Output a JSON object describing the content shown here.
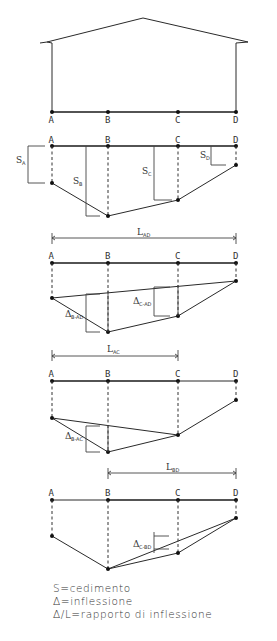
{
  "diagram": {
    "points": [
      "A",
      "B",
      "C",
      "D"
    ],
    "panels": [
      {
        "id": "building",
        "description": "Edificio su fondazione A-B-C-D"
      },
      {
        "id": "settlement",
        "labels": {
          "SA": "S",
          "SA_sub": "A",
          "SB": "S",
          "SB_sub": "B",
          "SC": "S",
          "SC_sub": "C",
          "SD": "S",
          "SD_sub": "D"
        }
      },
      {
        "id": "deflection-AD",
        "span_label": "L",
        "span_sub": "AD",
        "deltas": [
          {
            "sym": "Δ",
            "sub": "B-AD"
          },
          {
            "sym": "Δ",
            "sub": "C-AD"
          }
        ]
      },
      {
        "id": "deflection-AC",
        "span_label": "L",
        "span_sub": "AC",
        "deltas": [
          {
            "sym": "Δ",
            "sub": "B-AC"
          }
        ]
      },
      {
        "id": "deflection-BD",
        "span_label": "L",
        "span_sub": "BD",
        "deltas": [
          {
            "sym": "Δ",
            "sub": "C-BD"
          }
        ]
      }
    ]
  },
  "legend": {
    "line1": "S=cedimento",
    "line2": "Δ=inflessione",
    "line3": "Δ/L=rapporto di inflessione"
  }
}
